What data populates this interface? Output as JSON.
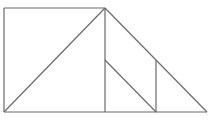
{
  "figure": {
    "type": "line-diagram",
    "canvas": {
      "width": 211,
      "height": 120
    },
    "background_color": "#ffffff",
    "stroke_color": "#6a6a6a",
    "stroke_width": 1.2,
    "points": {
      "top_left": {
        "x": 4,
        "y": 8
      },
      "apex": {
        "x": 105,
        "y": 8
      },
      "bottom_left": {
        "x": 4,
        "y": 112
      },
      "bottom_right": {
        "x": 207,
        "y": 112
      },
      "base_mid": {
        "x": 105,
        "y": 112
      },
      "inner_apex": {
        "x": 105,
        "y": 60
      },
      "inner_right_top": {
        "x": 156,
        "y": 60
      },
      "inner_base": {
        "x": 156,
        "y": 112
      }
    },
    "segments": [
      {
        "name": "top-edge",
        "x1": 4,
        "y1": 8,
        "x2": 105,
        "y2": 8
      },
      {
        "name": "left-edge",
        "x1": 4,
        "y1": 8,
        "x2": 4,
        "y2": 112
      },
      {
        "name": "bottom-edge",
        "x1": 4,
        "y1": 112,
        "x2": 207,
        "y2": 112
      },
      {
        "name": "left-diagonal",
        "x1": 4,
        "y1": 112,
        "x2": 105,
        "y2": 8
      },
      {
        "name": "center-vertical",
        "x1": 105,
        "y1": 8,
        "x2": 105,
        "y2": 112
      },
      {
        "name": "right-diagonal",
        "x1": 105,
        "y1": 8,
        "x2": 207,
        "y2": 112
      },
      {
        "name": "inner-diagonal",
        "x1": 105,
        "y1": 60,
        "x2": 156,
        "y2": 112
      },
      {
        "name": "inner-vertical",
        "x1": 156,
        "y1": 60,
        "x2": 156,
        "y2": 112
      }
    ]
  }
}
